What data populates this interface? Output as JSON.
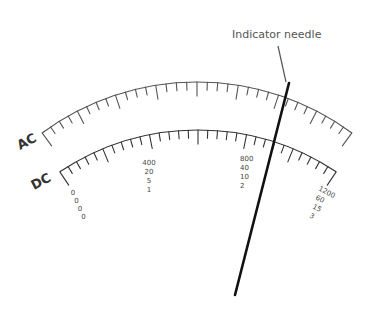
{
  "callout": {
    "label": "Indicator needle",
    "label_x": 232,
    "label_y": 38,
    "leader": {
      "x1": 278,
      "y1": 46,
      "x2": 286,
      "y2": 82
    }
  },
  "needle": {
    "x1": 289,
    "y1": 83,
    "x2": 235,
    "y2": 295
  },
  "scales": [
    {
      "id": "ac",
      "name": "AC",
      "name_x": 20,
      "name_y": 150,
      "name_rotate": -28,
      "center": [
        197,
        343
      ],
      "radius": 261,
      "start_deg": -36.4,
      "end_deg": 36.4,
      "tick_count": 32,
      "major_every": 4,
      "minor_len": 8,
      "major_len": 14,
      "end_len": 16,
      "color": "#555555"
    },
    {
      "id": "dc",
      "name": "DC",
      "name_x": 34,
      "name_y": 190,
      "name_rotate": -28,
      "center": [
        198,
        379
      ],
      "radius": 249,
      "start_deg": -33.7,
      "end_deg": 33.7,
      "tick_count": 30,
      "major_every": 5,
      "minor_len": 8,
      "major_len": 14,
      "end_len": 16,
      "color": "#333333"
    }
  ],
  "range_labels": [
    {
      "name": "zero-column",
      "values": [
        "0",
        "0",
        "0",
        "0"
      ],
      "x": 73,
      "y": 195,
      "dx": 3.5,
      "dy": 8,
      "rotate": 0
    },
    {
      "name": "quarter-column",
      "values": [
        "400",
        "20",
        "5",
        "1"
      ],
      "x": 149,
      "y": 165,
      "dx": 0,
      "dy": 9,
      "rotate": 0,
      "anchor": "middle"
    },
    {
      "name": "twothird-column",
      "values": [
        "800",
        "40",
        "10",
        "2"
      ],
      "x": 240,
      "y": 161,
      "dx": 0,
      "dy": 9,
      "rotate": 0,
      "anchor": "start"
    },
    {
      "name": "full-scale-column",
      "values": [
        "1200",
        "60",
        "15",
        "3"
      ],
      "x": 318,
      "y": 190,
      "dx": -3,
      "dy": 9,
      "rotate": 28,
      "anchor": "start"
    }
  ]
}
